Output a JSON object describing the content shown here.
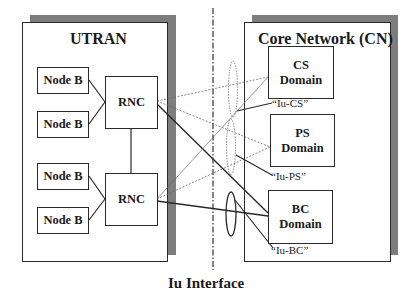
{
  "diagram": {
    "utran": {
      "title": "UTRAN",
      "node_bs": [
        "Node B",
        "Node B",
        "Node B",
        "Node B"
      ],
      "rncs": [
        "RNC",
        "RNC"
      ]
    },
    "core_network": {
      "title": "Core Network (CN)",
      "domains": [
        {
          "line1": "CS",
          "line2": "Domain",
          "interface_label": "“Iu-CS”"
        },
        {
          "line1": "PS",
          "line2": "Domain",
          "interface_label": "“Iu-PS”"
        },
        {
          "line1": "BC",
          "line2": "Domain",
          "interface_label": "“Iu-BC”"
        }
      ]
    },
    "caption": "Iu Interface",
    "colors": {
      "shadow": "#7d7d7d",
      "stroke": "#2a2a2a",
      "dotted": "#6a6a6a"
    }
  }
}
